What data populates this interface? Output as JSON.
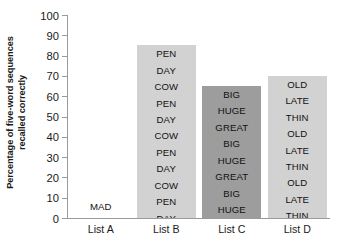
{
  "chart_data": {
    "type": "bar",
    "title": "",
    "xlabel": "",
    "ylabel_line1": "Percentage of five-word sequences",
    "ylabel_line2": "recalled correctly",
    "ylim": [
      0,
      100
    ],
    "ytick_labels": [
      "100",
      "90",
      "80",
      "70",
      "60",
      "50",
      "40",
      "30",
      "20",
      "10",
      "0"
    ],
    "ytick_values": [
      100,
      90,
      80,
      70,
      60,
      50,
      40,
      30,
      20,
      10,
      0
    ],
    "grid": false,
    "legend": "none",
    "categories": [
      "List A",
      "List B",
      "List C",
      "List D"
    ],
    "values": [
      0,
      85,
      65,
      70
    ],
    "series": [
      {
        "name": "Percentage recalled correctly",
        "values": [
          0,
          85,
          65,
          70
        ]
      }
    ],
    "bars": [
      {
        "category": "List A",
        "value": 0,
        "color": "#ffffff",
        "words": [
          "MAD"
        ]
      },
      {
        "category": "List B",
        "value": 85,
        "color": "#d2d2d2",
        "words": [
          "PEN",
          "DAY",
          "COW",
          "PEN",
          "DAY",
          "COW",
          "PEN",
          "DAY",
          "COW",
          "PEN",
          "DAY",
          "COW"
        ]
      },
      {
        "category": "List C",
        "value": 65,
        "color": "#9d9d9d",
        "words": [
          "BIG",
          "HUGE",
          "GREAT",
          "BIG",
          "HUGE",
          "GREAT",
          "BIG",
          "HUGE",
          "GREAT"
        ]
      },
      {
        "category": "List D",
        "value": 70,
        "color": "#d2d2d2",
        "words": [
          "OLD",
          "LATE",
          "THIN",
          "OLD",
          "LATE",
          "THIN",
          "OLD",
          "LATE",
          "THIN",
          "OLD"
        ]
      }
    ],
    "colors": {
      "bar_light": "#d2d2d2",
      "bar_dark": "#9d9d9d",
      "axis": "#9b9b9b",
      "text": "#1a1a1a",
      "background": "#ffffff"
    }
  }
}
